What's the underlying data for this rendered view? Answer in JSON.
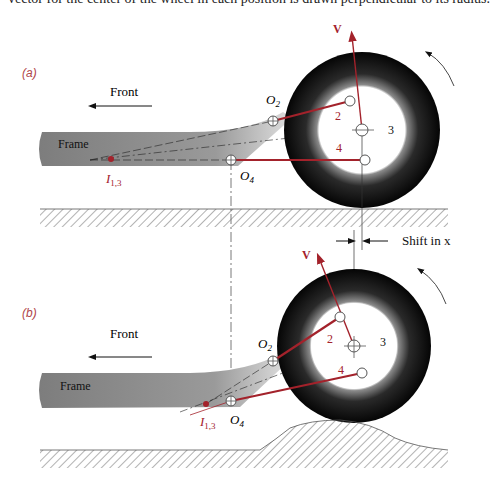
{
  "caption_top": "vector for the center of the wheel in each position is drawn perpendicular to its radius.",
  "colors": {
    "link_red": "#a3222b",
    "wheel_black": "#111111",
    "frame_gray": "#8c8c8c",
    "label_red": "#b0454a"
  },
  "panel_a": {
    "tag": "(a)",
    "front_label": "Front",
    "frame_label": "Frame",
    "velocity_label": "V",
    "o2_label": "O",
    "o2_sub": "2",
    "o4_label": "O",
    "o4_sub": "4",
    "ic_label": "I",
    "ic_sub": "1,3",
    "link2_label": "2",
    "link3_label": "3",
    "link4_label": "4"
  },
  "shift_label": "Shift in x",
  "panel_b": {
    "tag": "(b)",
    "front_label": "Front",
    "frame_label": "Frame",
    "velocity_label": "V",
    "o2_label": "O",
    "o2_sub": "2",
    "o4_label": "O",
    "o4_sub": "4",
    "ic_label": "I",
    "ic_sub": "1,3",
    "link2_label": "2",
    "link3_label": "3",
    "link4_label": "4"
  }
}
